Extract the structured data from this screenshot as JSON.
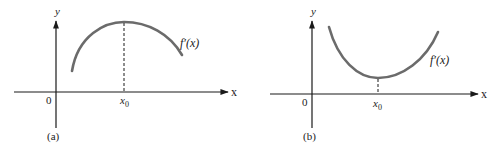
{
  "figure": {
    "panels": [
      {
        "id": "a",
        "caption": "(a)",
        "y_axis_label": "y",
        "x_axis_label": "x",
        "origin_label": "0",
        "x0_label": "x",
        "x0_subscript": "0",
        "curve_label": "f′(x)",
        "curve_shape": "concave down, maximum at x0"
      },
      {
        "id": "b",
        "caption": "(b)",
        "y_axis_label": "y",
        "x_axis_label": "x",
        "origin_label": "0",
        "x0_label": "x",
        "x0_subscript": "0",
        "curve_label": "f′(x)",
        "curve_shape": "concave up, minimum at x0"
      }
    ],
    "colors": {
      "axis": "#1a1a1a",
      "curve": "#6b6b6b",
      "text": "#222222"
    }
  }
}
